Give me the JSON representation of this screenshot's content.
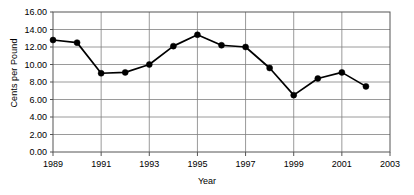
{
  "chart_data": {
    "type": "line",
    "title": "",
    "xlabel": "Year",
    "ylabel": "Cents per Pound",
    "x": [
      1989,
      1990,
      1991,
      1992,
      1993,
      1994,
      1995,
      1996,
      1997,
      1998,
      1999,
      2000,
      2001,
      2002
    ],
    "values": [
      12.8,
      12.5,
      9.0,
      9.1,
      10.0,
      12.1,
      13.4,
      12.2,
      12.0,
      9.6,
      6.5,
      8.4,
      9.1,
      7.5
    ],
    "series": [
      {
        "name": "Cents per Pound",
        "values": [
          12.8,
          12.5,
          9.0,
          9.1,
          10.0,
          12.1,
          13.4,
          12.2,
          12.0,
          9.6,
          6.5,
          8.4,
          9.1,
          7.5
        ]
      }
    ],
    "xlim": [
      1989,
      2003
    ],
    "ylim": [
      0.0,
      16.0
    ],
    "ytick_values": [
      0.0,
      2.0,
      4.0,
      6.0,
      8.0,
      10.0,
      12.0,
      14.0,
      16.0
    ],
    "ytick_labels": [
      "0.00",
      "2.00",
      "4.00",
      "6.00",
      "8.00",
      "10.00",
      "12.00",
      "14.00",
      "16.00"
    ],
    "xtick_values": [
      1989,
      1991,
      1993,
      1995,
      1997,
      1999,
      2001,
      2003
    ],
    "xtick_labels": [
      "1989",
      "1991",
      "1993",
      "1995",
      "1997",
      "1999",
      "2001",
      "2003"
    ],
    "grid": "both",
    "legend": "none",
    "marker": "filled-circle",
    "line_color": "#000000",
    "grid_color": "#808080"
  }
}
